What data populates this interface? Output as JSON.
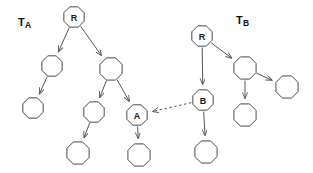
{
  "diagram": {
    "width": 313,
    "height": 173,
    "background_color": "#ffffff",
    "node_stroke_color": "#4a4a4a",
    "node_fill_color": "#ffffff",
    "edge_color": "#555555",
    "label_color": "#111111"
  },
  "labels": {
    "tree_a": {
      "base": "T",
      "sub": "A"
    },
    "tree_b": {
      "base": "T",
      "sub": "B"
    }
  },
  "trees": [
    {
      "id": "tree-a",
      "name": "T_A",
      "nodes": [
        {
          "id": "a-root",
          "label": "R",
          "cx": 74,
          "cy": 17,
          "r": 11
        },
        {
          "id": "a-n1",
          "label": "",
          "cx": 52,
          "cy": 66,
          "r": 11
        },
        {
          "id": "a-n2",
          "label": "",
          "cx": 111,
          "cy": 69,
          "r": 12
        },
        {
          "id": "a-n3",
          "label": "",
          "cx": 33,
          "cy": 108,
          "r": 11
        },
        {
          "id": "a-n4",
          "label": "",
          "cx": 94,
          "cy": 112,
          "r": 11
        },
        {
          "id": "a-a",
          "label": "A",
          "cx": 137,
          "cy": 115,
          "r": 11
        },
        {
          "id": "a-n5",
          "label": "",
          "cx": 78,
          "cy": 153,
          "r": 12
        },
        {
          "id": "a-n6",
          "label": "",
          "cx": 139,
          "cy": 155,
          "r": 12
        }
      ],
      "edges": [
        {
          "from": "a-root",
          "to": "a-n1"
        },
        {
          "from": "a-root",
          "to": "a-n2"
        },
        {
          "from": "a-n1",
          "to": "a-n3"
        },
        {
          "from": "a-n2",
          "to": "a-n4"
        },
        {
          "from": "a-n2",
          "to": "a-a"
        },
        {
          "from": "a-n4",
          "to": "a-n5"
        },
        {
          "from": "a-a",
          "to": "a-n6"
        }
      ]
    },
    {
      "id": "tree-b",
      "name": "T_B",
      "nodes": [
        {
          "id": "b-root",
          "label": "R",
          "cx": 202,
          "cy": 36,
          "r": 11
        },
        {
          "id": "b-n1",
          "label": "",
          "cx": 245,
          "cy": 68,
          "r": 12
        },
        {
          "id": "b-b",
          "label": "B",
          "cx": 203,
          "cy": 100,
          "r": 11
        },
        {
          "id": "b-n2",
          "label": "",
          "cx": 287,
          "cy": 87,
          "r": 12
        },
        {
          "id": "b-n3",
          "label": "",
          "cx": 245,
          "cy": 115,
          "r": 12
        },
        {
          "id": "b-n4",
          "label": "",
          "cx": 206,
          "cy": 152,
          "r": 12
        }
      ],
      "edges": [
        {
          "from": "b-root",
          "to": "b-b"
        },
        {
          "from": "b-root",
          "to": "b-n1"
        },
        {
          "from": "b-n1",
          "to": "b-n2"
        },
        {
          "from": "b-n1",
          "to": "b-n3"
        },
        {
          "from": "b-b",
          "to": "b-n4"
        }
      ]
    }
  ],
  "cross_link": {
    "id": "link-b-to-a",
    "from": "b-b",
    "to": "a-a",
    "style": "dashed",
    "direction": "right-to-left"
  }
}
